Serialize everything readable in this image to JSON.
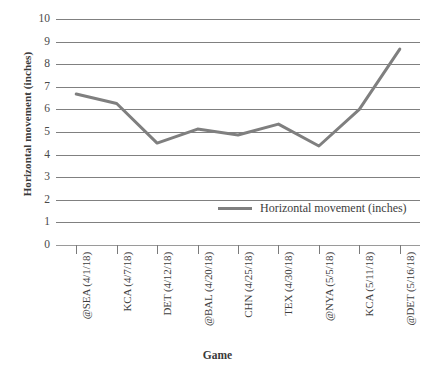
{
  "chart_data": {
    "type": "line",
    "title": "",
    "xlabel": "Game",
    "ylabel": "Horizontal movement (inches)",
    "categories": [
      "@SEA (4/1/18)",
      "KCA (4/7/18)",
      "DET (4/12/18)",
      "@BAL (4/20/18)",
      "CHN (4/25/18)",
      "TEX (4/30/18)",
      "@NYA (5/5/18)",
      "KCA (5/11/18)",
      "@DET (5/16/18)"
    ],
    "series": [
      {
        "name": "Horizontal movement (inches)",
        "values": [
          6.68,
          6.26,
          4.51,
          5.13,
          4.87,
          5.35,
          4.38,
          6.0,
          8.67
        ],
        "color": "#7f7f7f"
      }
    ],
    "ylim": [
      0,
      10
    ],
    "yticks": [
      "0",
      "1",
      "2",
      "3",
      "4",
      "5",
      "6",
      "7",
      "8",
      "9",
      "10"
    ],
    "grid": true,
    "legend_position": "inside-center-right",
    "legend_entries": [
      "Horizontal movement (inches)"
    ]
  },
  "axes": {
    "y_title": "Horizontal movement (inches)",
    "x_title": "Game"
  },
  "legend": {
    "label": "Horizontal movement (inches)"
  },
  "colors": {
    "series": "#7f7f7f",
    "gridline": "#808080",
    "baseline": "#9a9a9a",
    "text": "#3d3d3d",
    "background": "#ffffff"
  }
}
